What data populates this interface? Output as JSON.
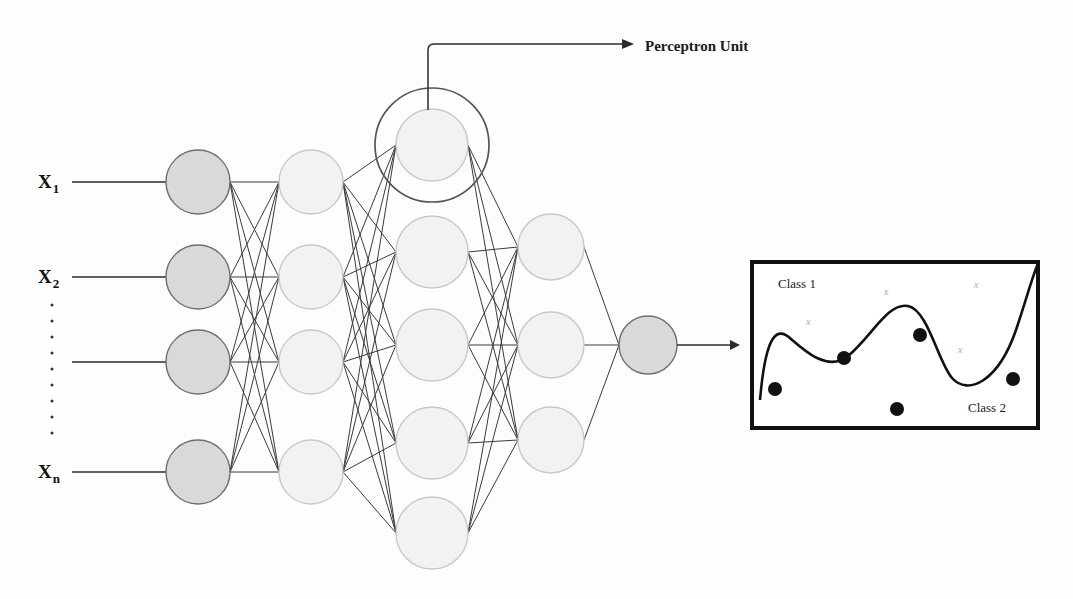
{
  "figure": {
    "background": "#fdfdfd",
    "width": 1073,
    "height": 599
  },
  "inputs": {
    "labels": [
      {
        "base": "X",
        "sub": "1",
        "y": 182
      },
      {
        "base": "X",
        "sub": "2",
        "y": 277
      },
      {
        "base": "X",
        "sub": "n",
        "y": 472
      }
    ],
    "ellipsis_dots": 9,
    "ellipsis_x": 52,
    "ellipsis_y_start": 305,
    "ellipsis_y_step": 16
  },
  "annotation": {
    "perceptron_label": "Perceptron Unit",
    "label_x": 645,
    "label_y": 51,
    "leader_from_x": 428,
    "leader_from_y": 110,
    "leader_corner_y": 44,
    "leader_to_x": 634
  },
  "network": {
    "colors": {
      "node_dark_fill": "#d9d9d9",
      "node_light_fill": "#f2f2f2",
      "node_stroke_dark": "#6e6e6e",
      "node_stroke_light": "#c8c8c8",
      "edge_stroke": "#3a3a3a",
      "ring_stroke": "#555555",
      "input_line": "#2b2b2b"
    },
    "layers": [
      {
        "name": "input-layer",
        "cx": 198,
        "r": 32,
        "fill": "#d9d9d9",
        "stroke": "#6e6e6e",
        "nodes_y": [
          182,
          277,
          362,
          472
        ]
      },
      {
        "name": "hidden-layer-1",
        "cx": 311,
        "r": 32,
        "fill": "#f2f2f2",
        "stroke": "#c8c8c8",
        "nodes_y": [
          182,
          277,
          362,
          472
        ]
      },
      {
        "name": "hidden-layer-2",
        "cx": 432,
        "r": 36,
        "fill": "#f2f2f2",
        "stroke": "#c8c8c8",
        "nodes_y": [
          145,
          252,
          345,
          443,
          533
        ]
      },
      {
        "name": "hidden-layer-3",
        "cx": 551,
        "r": 33,
        "fill": "#f2f2f2",
        "stroke": "#c8c8c8",
        "nodes_y": [
          247,
          345,
          440
        ]
      },
      {
        "name": "output-layer",
        "cx": 648,
        "r": 29,
        "fill": "#d9d9d9",
        "stroke": "#6e6e6e",
        "nodes_y": [
          345
        ]
      }
    ],
    "perceptron_ring": {
      "cx": 432,
      "cy": 145,
      "r": 57
    },
    "input_lines": {
      "x_start": 72,
      "x_end": 166,
      "ys": [
        182,
        277,
        362,
        472
      ]
    },
    "output_arrow": {
      "x_start": 677,
      "x_end": 740,
      "y": 345
    }
  },
  "classification_box": {
    "x": 752,
    "y": 262,
    "width": 286,
    "height": 166,
    "stroke": "#111111",
    "stroke_width": 4,
    "class1_label": "Class 1",
    "class1_x": 778,
    "class1_y": 288,
    "class2_label": "Class 2",
    "class2_x": 968,
    "class2_y": 412,
    "boundary_path": "M 760,400 C 766,330 778,328 790,338 C 806,352 828,372 848,356 C 872,336 888,302 908,306 C 928,310 938,362 952,378 C 968,396 998,382 1016,330 C 1026,300 1032,278 1037,266",
    "boundary_stroke": "#111111",
    "boundary_width": 2.6,
    "dots": [
      {
        "cx": 775,
        "cy": 389,
        "r": 7
      },
      {
        "cx": 844,
        "cy": 358,
        "r": 7
      },
      {
        "cx": 920,
        "cy": 335,
        "r": 7
      },
      {
        "cx": 897,
        "cy": 409,
        "r": 7
      },
      {
        "cx": 1013,
        "cy": 379,
        "r": 7
      }
    ],
    "dot_fill": "#111111",
    "x_marks": [
      {
        "x": 806,
        "y": 325,
        "glyph": "x"
      },
      {
        "x": 884,
        "y": 295,
        "glyph": "x"
      },
      {
        "x": 974,
        "y": 288,
        "glyph": "x"
      },
      {
        "x": 958,
        "y": 353,
        "glyph": "x"
      }
    ]
  }
}
